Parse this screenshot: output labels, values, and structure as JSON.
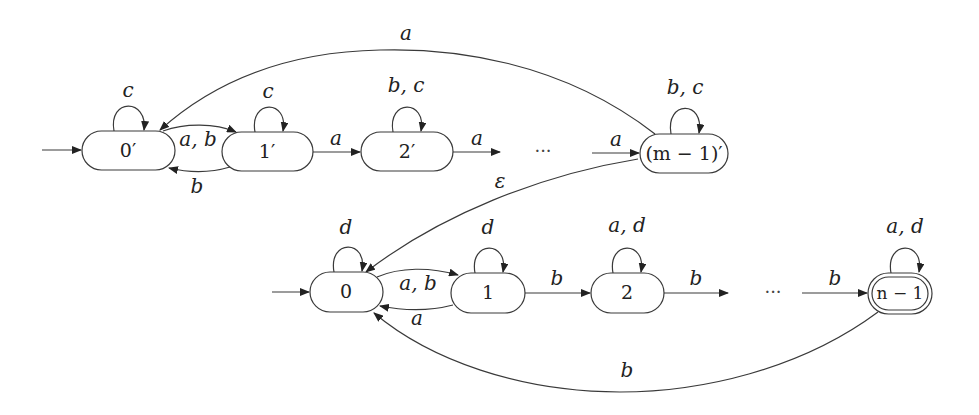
{
  "diagram": {
    "type": "finite-automaton",
    "top_automaton": {
      "states": [
        {
          "id": "0p",
          "label": "0′",
          "initial": true,
          "accepting": false,
          "self_loop": "c"
        },
        {
          "id": "1p",
          "label": "1′",
          "initial": false,
          "accepting": false,
          "self_loop": "c"
        },
        {
          "id": "2p",
          "label": "2′",
          "initial": false,
          "accepting": false,
          "self_loop": "b, c"
        },
        {
          "id": "mp",
          "label": "(m − 1)′",
          "initial": false,
          "accepting": false,
          "self_loop": "b, c"
        }
      ],
      "ellipsis": "···",
      "transitions": [
        {
          "from": "0p",
          "to": "1p",
          "label": "a, b"
        },
        {
          "from": "1p",
          "to": "0p",
          "label": "b"
        },
        {
          "from": "1p",
          "to": "2p",
          "label": "a"
        },
        {
          "from": "2p",
          "to": "…",
          "label": "a"
        },
        {
          "from": "…",
          "to": "mp",
          "label": "a"
        },
        {
          "from": "mp",
          "to": "0p",
          "label": "a"
        }
      ]
    },
    "link": {
      "from": "mp",
      "to": "0",
      "label": "ε"
    },
    "bottom_automaton": {
      "states": [
        {
          "id": "0",
          "label": "0",
          "initial": true,
          "accepting": false,
          "self_loop": "d"
        },
        {
          "id": "1",
          "label": "1",
          "initial": false,
          "accepting": false,
          "self_loop": "d"
        },
        {
          "id": "2",
          "label": "2",
          "initial": false,
          "accepting": false,
          "self_loop": "a, d"
        },
        {
          "id": "n",
          "label": "n − 1",
          "initial": false,
          "accepting": true,
          "self_loop": "a, d"
        }
      ],
      "ellipsis": "···",
      "transitions": [
        {
          "from": "0",
          "to": "1",
          "label": "a, b"
        },
        {
          "from": "1",
          "to": "0",
          "label": "a"
        },
        {
          "from": "1",
          "to": "2",
          "label": "b"
        },
        {
          "from": "2",
          "to": "…",
          "label": "b"
        },
        {
          "from": "…",
          "to": "n",
          "label": "b"
        },
        {
          "from": "n",
          "to": "0",
          "label": "b"
        }
      ]
    }
  }
}
